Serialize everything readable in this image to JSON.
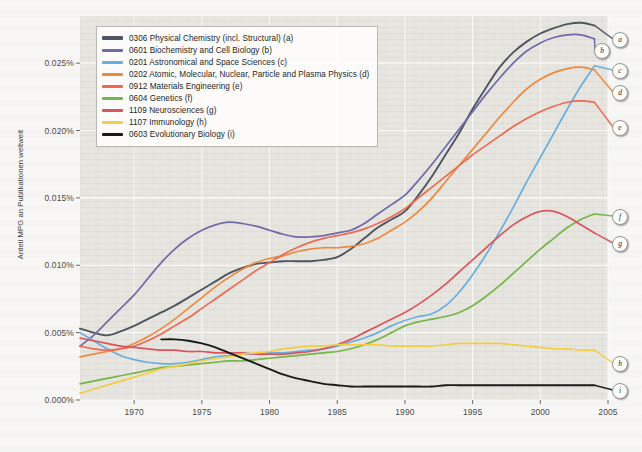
{
  "chart_data": {
    "type": "line",
    "title": "",
    "xlabel": "",
    "ylabel": "Anteil MPG an Publikationen weltweit",
    "xlim": [
      1966,
      2005
    ],
    "ylim": [
      0.0,
      0.0285
    ],
    "grid": true,
    "legend_position": "top-left",
    "y_tick_labels": [
      "0.000%",
      "0.005%",
      "0.010%",
      "0.015%",
      "0.020%",
      "0.025%"
    ],
    "y_tick_values": [
      0.0,
      0.005,
      0.01,
      0.015,
      0.02,
      0.025
    ],
    "x_tick_labels": [
      "1970",
      "1975",
      "1980",
      "1985",
      "1990",
      "1995",
      "2000",
      "2005"
    ],
    "x_tick_values": [
      1970,
      1975,
      1980,
      1985,
      1990,
      1995,
      2000,
      2005
    ],
    "x": [
      1966,
      1967,
      1968,
      1969,
      1970,
      1971,
      1972,
      1973,
      1974,
      1975,
      1976,
      1977,
      1978,
      1979,
      1980,
      1981,
      1982,
      1983,
      1984,
      1985,
      1986,
      1987,
      1988,
      1989,
      1990,
      1991,
      1992,
      1993,
      1994,
      1995,
      1996,
      1997,
      1998,
      1999,
      2000,
      2001,
      2002,
      2003,
      2004
    ],
    "series": [
      {
        "name": "0306 Physical Chemistry (incl. Structural)",
        "key": "a",
        "color": "#4e5560",
        "values": [
          0.0053,
          0.005,
          0.0048,
          0.0051,
          0.0055,
          0.006,
          0.0065,
          0.007,
          0.0076,
          0.0082,
          0.0088,
          0.0094,
          0.0098,
          0.0101,
          0.0102,
          0.0103,
          0.0103,
          0.0103,
          0.0104,
          0.0106,
          0.0112,
          0.012,
          0.0128,
          0.0134,
          0.014,
          0.0152,
          0.0166,
          0.0182,
          0.0198,
          0.0216,
          0.0232,
          0.0247,
          0.0258,
          0.0266,
          0.0272,
          0.0276,
          0.0279,
          0.028,
          0.0278
        ]
      },
      {
        "name": "0601 Biochemistry and Cell Biology",
        "key": "b",
        "color": "#6f6aa8",
        "values": [
          0.004,
          0.0048,
          0.0058,
          0.0068,
          0.0078,
          0.009,
          0.0102,
          0.0112,
          0.012,
          0.0126,
          0.013,
          0.0132,
          0.0131,
          0.0129,
          0.0126,
          0.0123,
          0.0121,
          0.0121,
          0.0122,
          0.0124,
          0.0126,
          0.0131,
          0.0138,
          0.0145,
          0.0152,
          0.0163,
          0.0175,
          0.0188,
          0.0201,
          0.0214,
          0.0227,
          0.0239,
          0.025,
          0.0259,
          0.0265,
          0.0269,
          0.0271,
          0.0271,
          0.0268
        ]
      },
      {
        "name": "0201 Astronomical and Space Sciences",
        "key": "c",
        "color": "#6aaede"
      },
      {
        "name": "0202 Atomic, Molecular, Nuclear, Particle and Plasma Physics",
        "key": "d",
        "color": "#ed8a3e"
      },
      {
        "name": "0912 Materials Engineering",
        "key": "e",
        "color": "#ed6a50"
      },
      {
        "name": "0604 Genetics",
        "key": "f",
        "color": "#76b547"
      },
      {
        "name": "1109 Neurosciences",
        "key": "g",
        "color": "#d8555f"
      },
      {
        "name": "1107 Immunology",
        "key": "h",
        "color": "#f2cd47"
      },
      {
        "name": "0603 Evolutionary Biology",
        "key": "i",
        "color": "#1a1a1a"
      }
    ],
    "series_values": {
      "c": [
        0.005,
        0.0044,
        0.0038,
        0.0033,
        0.003,
        0.0028,
        0.0027,
        0.0027,
        0.0028,
        0.003,
        0.0032,
        0.0033,
        0.0034,
        0.0034,
        0.0035,
        0.0035,
        0.0036,
        0.0037,
        0.0038,
        0.004,
        0.0043,
        0.0046,
        0.005,
        0.0055,
        0.0059,
        0.0062,
        0.0064,
        0.007,
        0.008,
        0.0093,
        0.0108,
        0.0125,
        0.0143,
        0.0162,
        0.018,
        0.0198,
        0.0216,
        0.0233,
        0.0248
      ],
      "d": [
        0.0032,
        0.0034,
        0.0036,
        0.0038,
        0.0042,
        0.0047,
        0.0053,
        0.006,
        0.0068,
        0.0076,
        0.0084,
        0.0091,
        0.0097,
        0.0102,
        0.0105,
        0.0107,
        0.011,
        0.0112,
        0.0113,
        0.0113,
        0.0114,
        0.0116,
        0.012,
        0.0126,
        0.0132,
        0.014,
        0.015,
        0.0162,
        0.0174,
        0.0186,
        0.0198,
        0.021,
        0.0221,
        0.0231,
        0.0238,
        0.0243,
        0.0246,
        0.0247,
        0.0245
      ],
      "e": [
        0.004,
        0.0038,
        0.0037,
        0.0038,
        0.004,
        0.0044,
        0.0049,
        0.0055,
        0.0061,
        0.0068,
        0.0075,
        0.0082,
        0.0089,
        0.0096,
        0.0102,
        0.0108,
        0.0113,
        0.0117,
        0.012,
        0.0122,
        0.0124,
        0.0127,
        0.0131,
        0.0136,
        0.0142,
        0.015,
        0.0158,
        0.0166,
        0.0174,
        0.0182,
        0.0189,
        0.0196,
        0.0203,
        0.0209,
        0.0214,
        0.0218,
        0.0221,
        0.0222,
        0.0221
      ],
      "f": [
        0.0012,
        0.0014,
        0.0016,
        0.0018,
        0.002,
        0.0022,
        0.0024,
        0.0025,
        0.0026,
        0.0027,
        0.0028,
        0.0029,
        0.0029,
        0.003,
        0.0031,
        0.0032,
        0.0033,
        0.0034,
        0.0035,
        0.0036,
        0.0038,
        0.0041,
        0.0045,
        0.005,
        0.0055,
        0.0058,
        0.006,
        0.0062,
        0.0065,
        0.007,
        0.0077,
        0.0085,
        0.0094,
        0.0103,
        0.0112,
        0.012,
        0.0128,
        0.0134,
        0.0138
      ],
      "g": [
        0.0046,
        0.0044,
        0.0042,
        0.004,
        0.0039,
        0.0038,
        0.0037,
        0.0037,
        0.0036,
        0.0036,
        0.0035,
        0.0035,
        0.0035,
        0.0034,
        0.0034,
        0.0034,
        0.0035,
        0.0036,
        0.0038,
        0.0041,
        0.0045,
        0.005,
        0.0055,
        0.006,
        0.0065,
        0.0071,
        0.0078,
        0.0086,
        0.0095,
        0.0104,
        0.0113,
        0.0122,
        0.013,
        0.0136,
        0.014,
        0.014,
        0.0136,
        0.013,
        0.0124
      ],
      "h": [
        0.0005,
        0.0008,
        0.0011,
        0.0014,
        0.0017,
        0.002,
        0.0023,
        0.0025,
        0.0027,
        0.0029,
        0.0031,
        0.0032,
        0.0034,
        0.0035,
        0.0036,
        0.0038,
        0.0039,
        0.004,
        0.004,
        0.0041,
        0.0041,
        0.0041,
        0.0041,
        0.004,
        0.004,
        0.004,
        0.004,
        0.0041,
        0.0042,
        0.0042,
        0.0042,
        0.0042,
        0.0041,
        0.004,
        0.0039,
        0.0038,
        0.0038,
        0.0037,
        0.0037
      ],
      "i": [
        null,
        null,
        null,
        null,
        null,
        null,
        0.0045,
        0.0045,
        0.0044,
        0.0042,
        0.0039,
        0.0035,
        0.0031,
        0.0027,
        0.0023,
        0.0019,
        0.0016,
        0.0014,
        0.0012,
        0.0011,
        0.001,
        0.001,
        0.001,
        0.001,
        0.001,
        0.001,
        0.001,
        0.0011,
        0.0011,
        0.0011,
        0.0011,
        0.0011,
        0.0011,
        0.0011,
        0.0011,
        0.0011,
        0.0011,
        0.0011,
        0.0011
      ]
    },
    "end_labels": [
      {
        "key": "a",
        "label": "a"
      },
      {
        "key": "b",
        "label": "b"
      },
      {
        "key": "c",
        "label": "c"
      },
      {
        "key": "d",
        "label": "d"
      },
      {
        "key": "e",
        "label": "e"
      },
      {
        "key": "f",
        "label": "f"
      },
      {
        "key": "g",
        "label": "g"
      },
      {
        "key": "h",
        "label": "h"
      },
      {
        "key": "i",
        "label": "i"
      }
    ]
  },
  "legend": {
    "items": [
      {
        "label": "0306 Physical Chemistry (incl. Structural) (a)",
        "color": "#4e5560"
      },
      {
        "label": "0601 Biochemistry and Cell Biology (b)",
        "color": "#6f6aa8"
      },
      {
        "label": "0201 Astronomical and Space Sciences (c)",
        "color": "#6aaede"
      },
      {
        "label": "0202 Atomic, Molecular, Nuclear, Particle and Plasma Physics (d)",
        "color": "#ed8a3e"
      },
      {
        "label": "0912 Materials Engineering (e)",
        "color": "#ed6a50"
      },
      {
        "label": "0604 Genetics (f)",
        "color": "#76b547"
      },
      {
        "label": "1109 Neurosciences (g)",
        "color": "#d8555f"
      },
      {
        "label": "1107 Immunology (h)",
        "color": "#f2cd47"
      },
      {
        "label": "0603 Evolutionary Biology (i)",
        "color": "#1a1a1a"
      }
    ]
  }
}
